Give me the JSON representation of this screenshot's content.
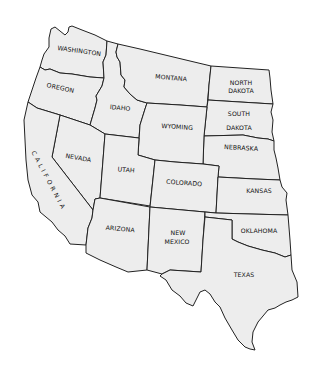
{
  "map": {
    "title": "Western United States",
    "fill_color": "#ededed",
    "stroke_color": "#222222",
    "states": [
      {
        "id": "washington",
        "label": "WASHINGTON",
        "x": 79,
        "y": 53,
        "rotate": 8
      },
      {
        "id": "oregon",
        "label": "OREGON",
        "x": 60,
        "y": 90,
        "rotate": 12
      },
      {
        "id": "idaho",
        "label": "IDAHO",
        "x": 120,
        "y": 110,
        "rotate": 5
      },
      {
        "id": "montana",
        "label": "MONTANA",
        "x": 171,
        "y": 80,
        "rotate": 5
      },
      {
        "id": "north-dakota",
        "label_line1": "NORTH",
        "label_line2": "DAKOTA",
        "x": 241,
        "y": 85
      },
      {
        "id": "south-dakota",
        "label_line1": "SOUTH",
        "label_line2": "DAKOTA",
        "x": 239,
        "y": 116
      },
      {
        "id": "nebraska",
        "label": "NEBRASKA",
        "x": 241,
        "y": 150,
        "rotate": 3
      },
      {
        "id": "wyoming",
        "label": "WYOMING",
        "x": 177,
        "y": 129,
        "rotate": 4
      },
      {
        "id": "nevada",
        "label": "NEVADA",
        "x": 78,
        "y": 160,
        "rotate": 10
      },
      {
        "id": "california",
        "label": "CALIFORNIA",
        "x": 45,
        "y": 180,
        "rotate": 60
      },
      {
        "id": "utah",
        "label": "UTAH",
        "x": 126,
        "y": 172,
        "rotate": 5
      },
      {
        "id": "colorado",
        "label": "COLORADO",
        "x": 184,
        "y": 184,
        "rotate": 4
      },
      {
        "id": "kansas",
        "label": "KANSAS",
        "x": 259,
        "y": 193
      },
      {
        "id": "arizona",
        "label": "ARIZONA",
        "x": 120,
        "y": 231,
        "rotate": 5
      },
      {
        "id": "new-mexico",
        "label_line1": "NEW",
        "label_line2": "MEXICO",
        "x": 177,
        "y": 233
      },
      {
        "id": "oklahoma",
        "label": "OKLAHOMA",
        "x": 259,
        "y": 233
      },
      {
        "id": "texas",
        "label": "TEXAS",
        "x": 244,
        "y": 277
      }
    ]
  }
}
